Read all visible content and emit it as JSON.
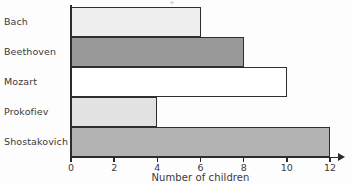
{
  "chart_data": {
    "type": "bar",
    "orientation": "horizontal",
    "title": "",
    "xlabel": "Number of children",
    "ylabel": "",
    "categories": [
      "Bach",
      "Beethoven",
      "Mozart",
      "Prokofiev",
      "Shostakovich"
    ],
    "values": [
      6,
      8,
      10,
      4,
      12
    ],
    "xlim": [
      0,
      12
    ],
    "xticks": [
      0,
      2,
      4,
      6,
      8,
      10,
      12
    ],
    "xtick_labels": [
      "0",
      "2",
      "4",
      "6",
      "8",
      "10",
      "12"
    ],
    "grid": false,
    "legend": false,
    "bar_colors": [
      "#eeeeee",
      "#999999",
      "#ffffff",
      "#e2e2e2",
      "#b3b3b3"
    ],
    "bar_edge_color": "#2e2e2e",
    "axis_color": "#2b2b2b",
    "bars": [
      {
        "category": "Bach",
        "value": 6,
        "fill": "#eeeeee"
      },
      {
        "category": "Beethoven",
        "value": 8,
        "fill": "#999999"
      },
      {
        "category": "Mozart",
        "value": 10,
        "fill": "#ffffff"
      },
      {
        "category": "Prokofiev",
        "value": 4,
        "fill": "#e2e2e2"
      },
      {
        "category": "Shostakovich",
        "value": 12,
        "fill": "#b3b3b3"
      }
    ]
  }
}
